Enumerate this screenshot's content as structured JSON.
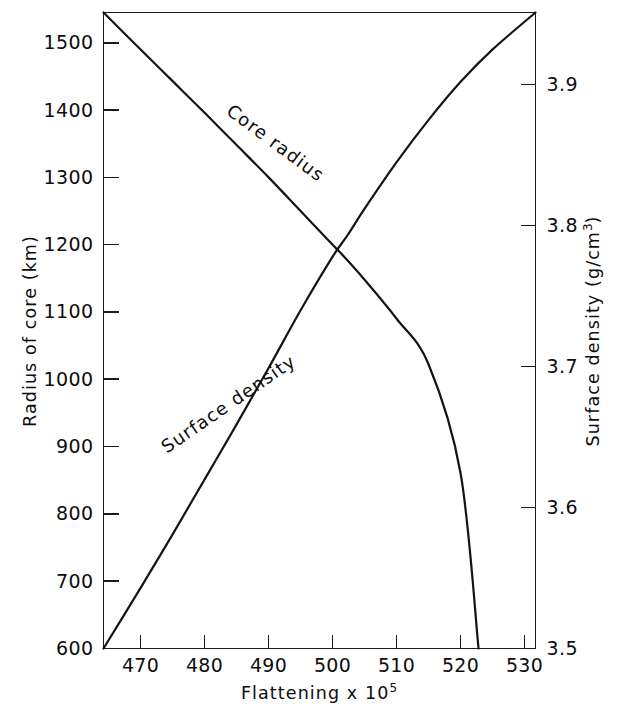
{
  "chart_data": {
    "type": "line",
    "title": "",
    "subtitle": "",
    "xlabel": "Flattening x 10",
    "xlabel_exponent": "5",
    "ylabel_left": "Radius of core (km)",
    "ylabel_right": "Surface density (g/cm",
    "ylabel_right_exponent": "3",
    "ylabel_right_tail": ")",
    "grid": false,
    "legend_position": "inline-curve-labels",
    "xlim": [
      464.2,
      531.7
    ],
    "ylim_left": [
      600,
      1545
    ],
    "ylim_right": [
      3.5,
      3.9512
    ],
    "xticks": [
      470,
      480,
      490,
      500,
      510,
      520,
      530
    ],
    "xtick_labels": [
      "470",
      "480",
      "490",
      "500",
      "510",
      "520",
      "530"
    ],
    "yticks_left": [
      600,
      700,
      800,
      900,
      1000,
      1100,
      1200,
      1300,
      1400,
      1500
    ],
    "ytick_labels_left": [
      "600",
      "700",
      "800",
      "900",
      "1000",
      "1100",
      "1200",
      "1300",
      "1400",
      "1500"
    ],
    "yticks_right": [
      3.5,
      3.6,
      3.7,
      3.8,
      3.9
    ],
    "ytick_labels_right": [
      "3.5",
      "3.6",
      "3.7",
      "3.8",
      "3.9"
    ],
    "series": [
      {
        "name": "Core radius",
        "label": "Core radius",
        "axis": "left",
        "color": "#141414",
        "label_rotation": 36.5,
        "label_x": 272,
        "label_y": 148,
        "x": [
          464.2,
          470,
          475,
          480,
          485,
          490,
          495,
          500,
          502.3,
          505,
          510,
          515,
          520,
          522.8
        ],
        "y": [
          1545,
          1490,
          1443,
          1396,
          1348,
          1300,
          1250,
          1200,
          1177,
          1148,
          1090,
          1022,
          860,
          600
        ]
      },
      {
        "name": "Surface density",
        "label": "Surface density",
        "axis": "right",
        "color": "#141414",
        "label_rotation": -34.5,
        "label_x": 232,
        "label_y": 409,
        "x": [
          464.2,
          470,
          475,
          480,
          485,
          490,
          495,
          500,
          502.3,
          505,
          510,
          515,
          520,
          525,
          531.7
        ],
        "y": [
          3.5,
          3.543,
          3.581,
          3.62,
          3.659,
          3.699,
          3.74,
          3.778,
          3.793,
          3.812,
          3.845,
          3.875,
          3.902,
          3.925,
          3.9512
        ]
      }
    ],
    "annotations": [
      {
        "text": "Core radius",
        "series": "Core radius"
      },
      {
        "text": "Surface density",
        "series": "Surface density"
      }
    ]
  },
  "figure": {
    "background": "#ffffff",
    "ink": "#141414"
  }
}
